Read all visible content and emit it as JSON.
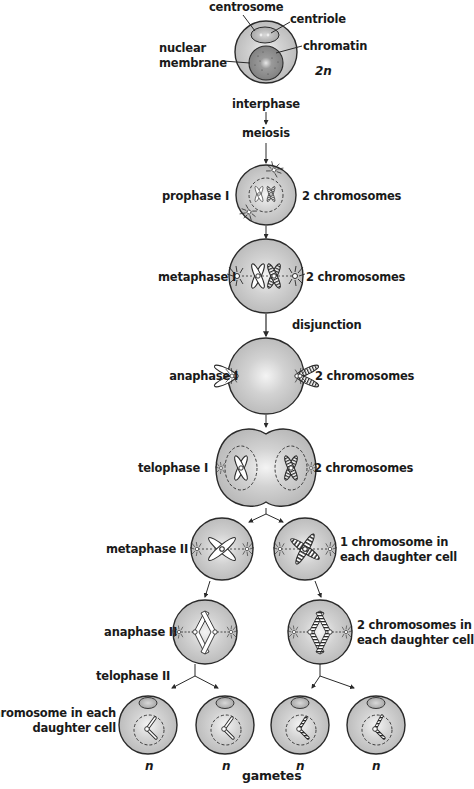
{
  "diagram": {
    "title": "Meiosis",
    "colors": {
      "cell_fill": "#c4c4c4",
      "cell_highlight": "#f2f2f2",
      "outline": "#2a2a2a",
      "nucleus_fill": "#8c8c8c",
      "background": "#ffffff"
    },
    "interphase_labels": {
      "centrosome": "centrosome",
      "centriole": "centriole",
      "nuclear_membrane_line1": "nuclear",
      "nuclear_membrane_line2": "membrane",
      "chromatin": "chromatin",
      "ploidy": "2n"
    },
    "flow_labels": {
      "interphase": "interphase",
      "meiosis": "meiosis",
      "disjunction": "disjunction",
      "gametes": "gametes"
    },
    "stages": [
      {
        "name": "prophase I",
        "count_label": "2 chromosomes"
      },
      {
        "name": "metaphase I",
        "count_label": "2 chromosomes"
      },
      {
        "name": "anaphase I",
        "count_label": "2 chromosomes"
      },
      {
        "name": "telophase I",
        "count_label": "2 chromosomes"
      },
      {
        "name": "metaphase II",
        "count_label_line1": "1 chromosome in",
        "count_label_line2": "each daughter cell"
      },
      {
        "name": "anaphase II",
        "count_label_line1": "2 chromosomes in",
        "count_label_line2": "each daughter cell"
      },
      {
        "name": "telophase II",
        "count_label_line1": "1 chromosome in each",
        "count_label_line2": "daughter cell"
      }
    ],
    "gamete_ploidy": [
      "n",
      "n",
      "n",
      "n"
    ]
  }
}
